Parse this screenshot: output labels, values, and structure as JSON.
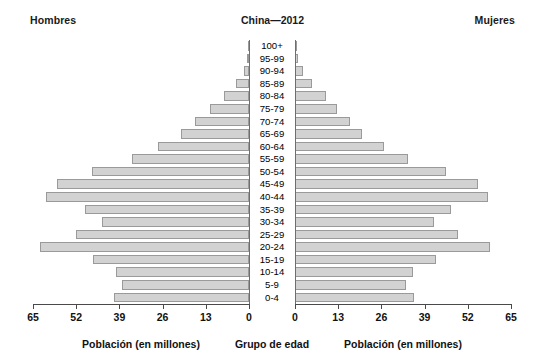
{
  "header": {
    "left_label": "Hombres",
    "title": "China—2012",
    "right_label": "Mujeres"
  },
  "axes": {
    "left_title": "Población (en millones)",
    "center_title": "Grupo de edad",
    "right_title": "Población (en millones)",
    "left_ticks": [
      "65",
      "52",
      "39",
      "26",
      "13",
      "0"
    ],
    "right_ticks": [
      "0",
      "13",
      "26",
      "39",
      "52",
      "65"
    ]
  },
  "colors": {
    "bar_fill": "#d2d2d2",
    "bar_stroke": "#9a9a9a",
    "axis": "#4a4a4a",
    "text": "#111111",
    "background": "#ffffff"
  },
  "chart_data": {
    "type": "bar",
    "title": "China—2012",
    "subtype": "population-pyramid",
    "xlabel": "Población (en millones)",
    "ylabel": "Grupo de edad",
    "xlim": [
      0,
      65
    ],
    "xticks": [
      0,
      13,
      26,
      39,
      52,
      65
    ],
    "grid": false,
    "legend_position": "none",
    "categories": [
      "100+",
      "95-99",
      "90-94",
      "85-89",
      "80-84",
      "75-79",
      "70-74",
      "65-69",
      "60-64",
      "55-59",
      "50-54",
      "45-49",
      "40-44",
      "35-39",
      "30-34",
      "25-29",
      "20-24",
      "15-19",
      "10-14",
      "5-9",
      "0-4"
    ],
    "series": [
      {
        "name": "Hombres",
        "side": "left",
        "values": [
          0.1,
          0.5,
          1.6,
          3.9,
          7.6,
          11.6,
          16.2,
          20.5,
          27.4,
          35.2,
          47.2,
          57.7,
          61.0,
          49.3,
          44.1,
          52.0,
          63.0,
          46.9,
          40.0,
          38.2,
          40.6
        ]
      },
      {
        "name": "Mujeres",
        "side": "right",
        "values": [
          0.2,
          0.9,
          2.5,
          5.2,
          9.2,
          12.6,
          16.6,
          20.2,
          26.8,
          34.1,
          45.3,
          55.0,
          58.1,
          46.8,
          41.8,
          49.1,
          58.6,
          42.5,
          35.4,
          33.5,
          35.7
        ]
      }
    ]
  }
}
